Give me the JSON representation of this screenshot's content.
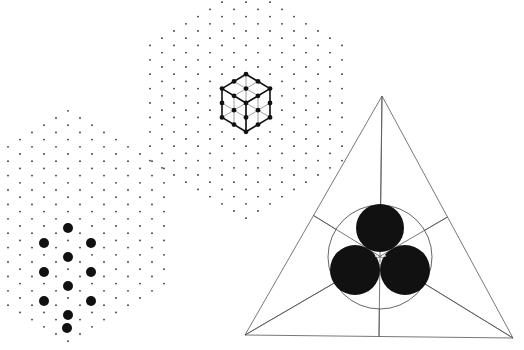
{
  "figure": {
    "background": "#ffffff",
    "ink": "#111111",
    "lattice_dot_color": "#333333",
    "line_color": "#555555",
    "panels": [
      {
        "id": "hexagon-cube-lattice",
        "description": "Hexagonal patch of triangular lattice points with a 2x2x2 cube drawn in isometric projection",
        "center": [
          246,
          103
        ],
        "lattice_step": 12,
        "radius_steps": 8,
        "cube": {
          "center": [
            246,
            103
          ],
          "size_steps": 2
        }
      },
      {
        "id": "hexagon-sphere-column",
        "description": "Hexagonal patch of triangular lattice points with a column of large filled dots",
        "center": [
          68,
          228
        ],
        "lattice_step": 12,
        "radius_steps": 8,
        "large_dots": [
          [
            68,
            228
          ],
          [
            44,
            243
          ],
          [
            91,
            243
          ],
          [
            68,
            257
          ],
          [
            44,
            272
          ],
          [
            91,
            272
          ],
          [
            68,
            286
          ],
          [
            44,
            301
          ],
          [
            91,
            301
          ],
          [
            68,
            315
          ],
          [
            67,
            328
          ]
        ],
        "large_dot_radius": 5
      },
      {
        "id": "triangle-three-circles",
        "description": "Equilateral triangle with medians, an inscribed circle around three mutually tangent filled discs",
        "vertices": [
          [
            382,
            96
          ],
          [
            245,
            335
          ],
          [
            513,
            338
          ]
        ],
        "outer_circle": {
          "center": [
            380,
            257
          ],
          "r": 52
        },
        "discs": [
          {
            "center": [
              380,
              228
            ],
            "r": 24
          },
          {
            "center": [
              355,
              270
            ],
            "r": 25
          },
          {
            "center": [
              405,
              270
            ],
            "r": 25
          }
        ]
      }
    ],
    "caption": ""
  }
}
